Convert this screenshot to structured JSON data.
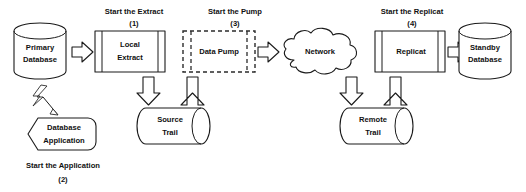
{
  "diagram": {
    "type": "flow-diagram",
    "colors": {
      "stroke": "#1a1a1a",
      "fill": "#ffffff",
      "dashed_stroke": "#2b2b2b",
      "text": "#111111",
      "background": "#ffffff"
    },
    "nodes": [
      {
        "id": "primary-database",
        "shape": "cylinder-vertical",
        "line1": "Primary",
        "line2": "Database"
      },
      {
        "id": "local-extract",
        "shape": "process-box",
        "line1": "Local",
        "line2": "Extract"
      },
      {
        "id": "source-trail",
        "shape": "cylinder-horizontal",
        "line1": "Source",
        "line2": "Trail"
      },
      {
        "id": "data-pump",
        "shape": "process-box-dashed",
        "line1": "Data Pump",
        "line2": ""
      },
      {
        "id": "network",
        "shape": "cloud",
        "line1": "Network",
        "line2": ""
      },
      {
        "id": "remote-trail",
        "shape": "cylinder-horizontal",
        "line1": "Remote",
        "line2": "Trail"
      },
      {
        "id": "replicat",
        "shape": "process-box",
        "line1": "Replicat",
        "line2": ""
      },
      {
        "id": "standby-database",
        "shape": "cylinder-vertical",
        "line1": "Standby",
        "line2": "Database"
      },
      {
        "id": "database-application",
        "shape": "hexagon",
        "line1": "Database",
        "line2": "Application"
      }
    ],
    "steps": [
      {
        "id": "step-extract",
        "label": "Start the Extract",
        "number": "(1)"
      },
      {
        "id": "step-application",
        "label": "Start the Application",
        "number": "(2)"
      },
      {
        "id": "step-pump",
        "label": "Start the Pump",
        "number": "(3)"
      },
      {
        "id": "step-replicat",
        "label": "Start the Replicat",
        "number": "(4)"
      }
    ],
    "connectors": [
      {
        "id": "primary-to-extract",
        "kind": "block-arrow",
        "direction": "right"
      },
      {
        "id": "extract-to-source",
        "kind": "block-arrow",
        "direction": "down"
      },
      {
        "id": "source-to-pump",
        "kind": "block-arrow",
        "direction": "up"
      },
      {
        "id": "pump-to-network",
        "kind": "block-arrow",
        "direction": "right"
      },
      {
        "id": "network-to-remote",
        "kind": "block-arrow",
        "direction": "down"
      },
      {
        "id": "remote-to-replicat",
        "kind": "block-arrow",
        "direction": "up"
      },
      {
        "id": "replicat-to-standby",
        "kind": "block-arrow",
        "direction": "right"
      },
      {
        "id": "application-to-primary",
        "kind": "lightning-bolt",
        "direction": "up-left"
      }
    ]
  }
}
